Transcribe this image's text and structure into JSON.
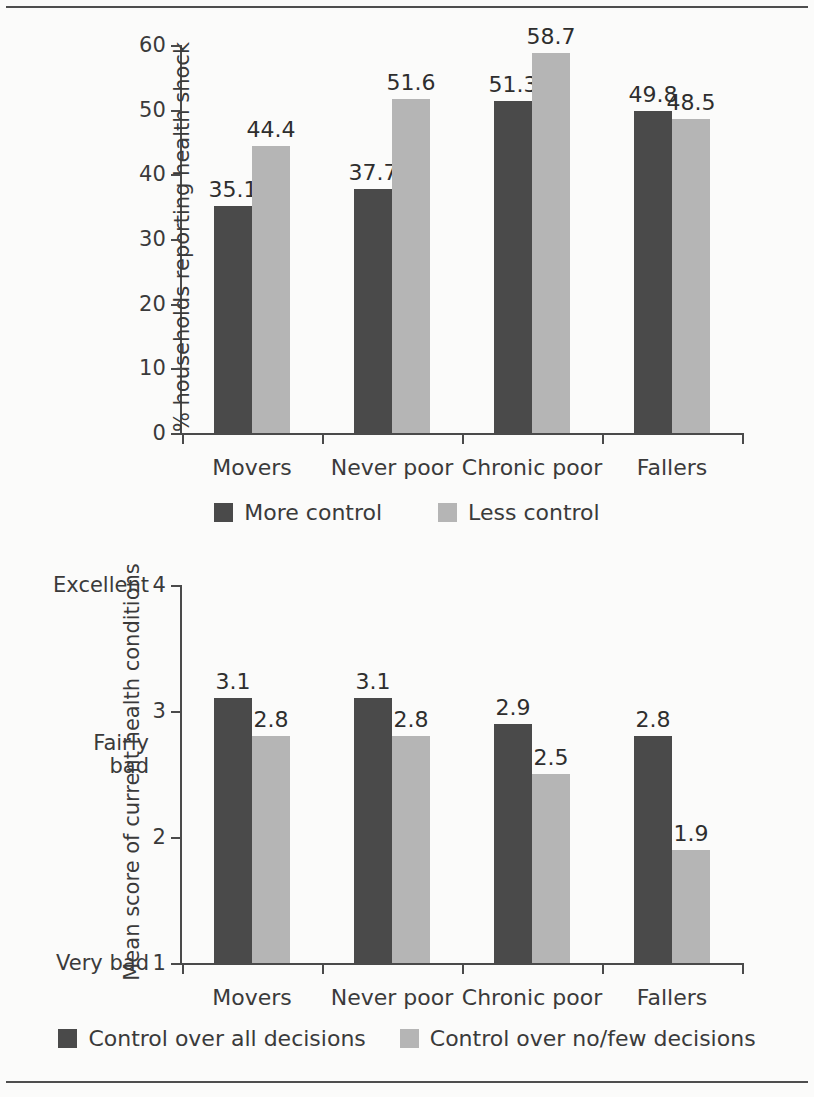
{
  "chart_data": [
    {
      "id": "health-shock",
      "type": "bar",
      "title": "",
      "xlabel": "",
      "ylabel": "% households reporting health shock",
      "ylim": [
        0,
        60
      ],
      "yticks": [
        0,
        10,
        20,
        30,
        40,
        50,
        60
      ],
      "ytick_labels": [
        "0",
        "10",
        "20",
        "30",
        "40",
        "50",
        "60"
      ],
      "grid": false,
      "legend_position": "bottom",
      "categories": [
        "Movers",
        "Never poor",
        "Chronic poor",
        "Fallers"
      ],
      "series": [
        {
          "name": "More control",
          "color": "#4a4a4a",
          "values": [
            35.1,
            37.7,
            51.3,
            49.8
          ],
          "labels": [
            "35.1",
            "37.7",
            "51.3",
            "49.8"
          ]
        },
        {
          "name": "Less control",
          "color": "#b5b5b5",
          "values": [
            44.4,
            51.6,
            58.7,
            48.5
          ],
          "labels": [
            "44.4",
            "51.6",
            "58.7",
            "48.5"
          ]
        }
      ]
    },
    {
      "id": "health-condition-score",
      "type": "bar",
      "title": "",
      "xlabel": "",
      "ylabel": "Mean score of current health conditions",
      "ylim": [
        1,
        4
      ],
      "yticks": [
        1,
        2,
        3,
        4
      ],
      "ytick_labels": [
        "1",
        "2",
        "3",
        "4"
      ],
      "yanchors": [
        {
          "value": 4,
          "label": "Excellent"
        },
        {
          "value": 2.65,
          "label": "Fairly\nbad"
        },
        {
          "value": 1,
          "label": "Very bad"
        }
      ],
      "grid": false,
      "legend_position": "bottom",
      "categories": [
        "Movers",
        "Never poor",
        "Chronic poor",
        "Fallers"
      ],
      "series": [
        {
          "name": "Control over all decisions",
          "color": "#4a4a4a",
          "values": [
            3.1,
            3.1,
            2.9,
            2.8
          ],
          "labels": [
            "3.1",
            "3.1",
            "2.9",
            "2.8"
          ]
        },
        {
          "name": "Control over no/few decisions",
          "color": "#b5b5b5",
          "values": [
            2.8,
            2.8,
            2.5,
            1.9
          ],
          "labels": [
            "2.8",
            "2.8",
            "2.5",
            "1.9"
          ]
        }
      ]
    }
  ]
}
